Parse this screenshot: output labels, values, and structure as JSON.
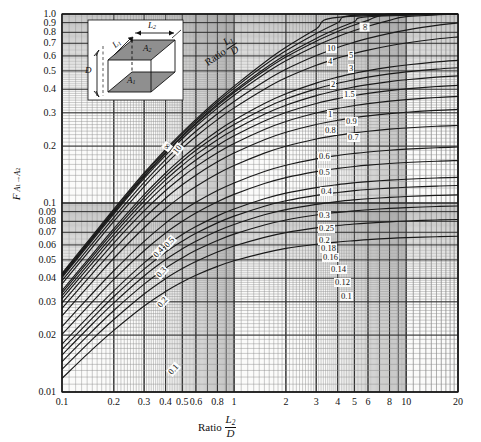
{
  "figure": {
    "kind": "view-factor-chart",
    "plot_box": {
      "left": 62,
      "top": 14,
      "right": 458,
      "bottom": 392
    },
    "background": "#ffffff",
    "grid_color": "#4a4a4a",
    "curve_color": "#1a1a1a",
    "panel_tint": "#f2f2f0"
  },
  "axes": {
    "y_title_F": "F",
    "y_title_sub_a1": "A",
    "y_title_sub_1": "1",
    "y_title_arrow": "→",
    "y_title_sub_a2": "A",
    "y_title_sub_2": "2",
    "y_title_plain": "F A1→A2",
    "x_title_word": "Ratio",
    "x_title_num": "L",
    "x_title_num_sub": "2",
    "x_title_den": "D",
    "x_title_plain": "Ratio L2/D",
    "y_scale": "log",
    "x_scale": "log",
    "ylim": [
      0.01,
      1.0
    ],
    "xlim": [
      0.1,
      20
    ],
    "y_ticks": [
      "0.01",
      "0.02",
      "0.03",
      "0.04",
      "0.05",
      "0.06",
      "0.07",
      "0.08",
      "0.09",
      "0.1",
      "0.2",
      "0.3",
      "0.4",
      "0.5",
      "0.6",
      "0.7",
      "0.8",
      "0.9",
      "1.0"
    ],
    "y_tick_values": [
      0.01,
      0.02,
      0.03,
      0.04,
      0.05,
      0.06,
      0.07,
      0.08,
      0.09,
      0.1,
      0.2,
      0.3,
      0.4,
      0.5,
      0.6,
      0.7,
      0.8,
      0.9,
      1.0
    ],
    "x_ticks": [
      "0.1",
      "0.2",
      "0.3",
      "0.4",
      "0.5",
      "0.6",
      "0.8",
      "1",
      "2",
      "3",
      "4",
      "5",
      "6",
      "8",
      "10",
      "20"
    ],
    "x_tick_values": [
      0.1,
      0.2,
      0.3,
      0.4,
      0.5,
      0.6,
      0.8,
      1,
      2,
      3,
      4,
      5,
      6,
      8,
      10,
      20
    ]
  },
  "family_label": {
    "word": "Ratio",
    "num": "L",
    "num_sub": "1",
    "den": "D",
    "plain": "Ratio L1/D"
  },
  "inset": {
    "a1": "A",
    "a1_sub": "1",
    "a2": "A",
    "a2_sub": "2",
    "l1": "L",
    "l1_sub": "1",
    "l2": "L",
    "l2_sub": "2",
    "d": "D",
    "face_fill": "#8f8f8f",
    "bg": "#ffffff",
    "description": "Two parallel coaxial rectangles A1 (lower) and A2 (upper) separated by distance D, sides L1 and L2"
  },
  "right_labels": [
    "∞",
    "10",
    "5",
    "4",
    "3",
    "2",
    "1.5",
    "1",
    "0.9",
    "0.8",
    "0.7",
    "0.6",
    "0.5",
    "0.4",
    "0.3",
    "0.25",
    "0.2",
    "0.18",
    "0.16",
    "0.14",
    "0.12",
    "0.1"
  ],
  "left_labels": [
    "10",
    "∞",
    "0.5",
    "0.4",
    "0.3",
    "0.2",
    "0.1"
  ],
  "chart_data": {
    "type": "line",
    "title": "",
    "subtitle": "",
    "xlabel": "Ratio L2/D",
    "ylabel": "F A1→A2",
    "xscale": "log",
    "yscale": "log",
    "xlim": [
      0.1,
      20
    ],
    "ylim": [
      0.01,
      1.0
    ],
    "grid": true,
    "legend_position": "inline-right-and-left-curve-end-labels",
    "legend_title": "Ratio L1/D",
    "x": [
      0.1,
      0.15,
      0.2,
      0.3,
      0.4,
      0.5,
      0.6,
      0.8,
      1,
      1.5,
      2,
      3,
      4,
      5,
      6,
      8,
      10,
      15,
      20
    ],
    "series": [
      {
        "name": "0.1",
        "values": [
          0.0118,
          0.0168,
          0.0212,
          0.0285,
          0.034,
          0.0382,
          0.0415,
          0.0462,
          0.0495,
          0.0545,
          0.0575,
          0.0605,
          0.0622,
          0.0632,
          0.064,
          0.065,
          0.0656,
          0.0663,
          0.0667
        ]
      },
      {
        "name": "0.12",
        "values": [
          0.0132,
          0.019,
          0.0242,
          0.033,
          0.0398,
          0.045,
          0.049,
          0.055,
          0.0592,
          0.0658,
          0.0697,
          0.0738,
          0.076,
          0.0774,
          0.0783,
          0.0795,
          0.0803,
          0.0813,
          0.0818
        ]
      },
      {
        "name": "0.14",
        "values": [
          0.0145,
          0.021,
          0.027,
          0.0372,
          0.0452,
          0.0513,
          0.0562,
          0.0633,
          0.0684,
          0.0765,
          0.0813,
          0.0864,
          0.0892,
          0.0909,
          0.0921,
          0.0936,
          0.0945,
          0.0958,
          0.0964
        ]
      },
      {
        "name": "0.16",
        "values": [
          0.0157,
          0.0229,
          0.0296,
          0.0411,
          0.0502,
          0.0572,
          0.0628,
          0.0711,
          0.077,
          0.0866,
          0.0923,
          0.0984,
          0.1018,
          0.1039,
          0.1053,
          0.1071,
          0.1082,
          0.1097,
          0.1104
        ]
      },
      {
        "name": "0.18",
        "values": [
          0.0168,
          0.0246,
          0.032,
          0.0447,
          0.0549,
          0.0628,
          0.0691,
          0.0785,
          0.0852,
          0.0962,
          0.1028,
          0.1098,
          0.1137,
          0.1162,
          0.1178,
          0.1199,
          0.1212,
          0.1229,
          0.1238
        ]
      },
      {
        "name": "0.2",
        "values": [
          0.0179,
          0.0263,
          0.0343,
          0.0482,
          0.0593,
          0.0681,
          0.075,
          0.0855,
          0.093,
          0.1053,
          0.1128,
          0.1207,
          0.1251,
          0.1279,
          0.1298,
          0.1322,
          0.1336,
          0.1356,
          0.1366
        ]
      },
      {
        "name": "0.25",
        "values": [
          0.0202,
          0.03,
          0.0394,
          0.0559,
          0.0694,
          0.08,
          0.0886,
          0.1016,
          0.1111,
          0.1268,
          0.1363,
          0.1466,
          0.1524,
          0.1561,
          0.1586,
          0.1618,
          0.1637,
          0.1664,
          0.1677
        ]
      },
      {
        "name": "0.3",
        "values": [
          0.0222,
          0.0332,
          0.0438,
          0.0627,
          0.0783,
          0.0907,
          0.1008,
          0.1163,
          0.1277,
          0.1467,
          0.1584,
          0.1712,
          0.1784,
          0.183,
          0.1862,
          0.1902,
          0.1927,
          0.1961,
          0.1978
        ]
      },
      {
        "name": "0.4",
        "values": [
          0.0253,
          0.0383,
          0.051,
          0.074,
          0.0935,
          0.1093,
          0.1223,
          0.1426,
          0.1578,
          0.1836,
          0.1998,
          0.218,
          0.2284,
          0.2351,
          0.2398,
          0.2458,
          0.2495,
          0.2546,
          0.2572
        ]
      },
      {
        "name": "0.5",
        "values": [
          0.0277,
          0.0423,
          0.0567,
          0.0832,
          0.106,
          0.1248,
          0.1404,
          0.1651,
          0.1838,
          0.216,
          0.2367,
          0.2603,
          0.274,
          0.2829,
          0.2891,
          0.2972,
          0.3022,
          0.3092,
          0.3127
        ]
      },
      {
        "name": "0.6",
        "values": [
          0.0296,
          0.0455,
          0.0614,
          0.0908,
          0.1164,
          0.1378,
          0.1558,
          0.1845,
          0.2065,
          0.245,
          0.2701,
          0.2993,
          0.3165,
          0.3278,
          0.3357,
          0.3461,
          0.3526,
          0.3617,
          0.3664
        ]
      },
      {
        "name": "0.7",
        "values": [
          0.0312,
          0.0481,
          0.0651,
          0.0971,
          0.1251,
          0.1488,
          0.1689,
          0.2015,
          0.2267,
          0.2713,
          0.301,
          0.3359,
          0.3568,
          0.3707,
          0.3805,
          0.3935,
          0.4017,
          0.4132,
          0.4191
        ]
      },
      {
        "name": "0.8",
        "values": [
          0.0324,
          0.0502,
          0.0683,
          0.1023,
          0.1325,
          0.1582,
          0.1802,
          0.2162,
          0.2444,
          0.295,
          0.3292,
          0.37,
          0.3948,
          0.4114,
          0.4232,
          0.439,
          0.449,
          0.4632,
          0.4705
        ]
      },
      {
        "name": "0.9",
        "values": [
          0.0335,
          0.052,
          0.0709,
          0.1068,
          0.1387,
          0.1663,
          0.19,
          0.2291,
          0.2601,
          0.3164,
          0.3549,
          0.4014,
          0.43,
          0.4494,
          0.4632,
          0.4818,
          0.4937,
          0.5107,
          0.5195
        ]
      },
      {
        "name": "1",
        "values": [
          0.0344,
          0.0535,
          0.0731,
          0.1106,
          0.1441,
          0.1732,
          0.1985,
          0.2404,
          0.2739,
          0.3357,
          0.3784,
          0.4307,
          0.4633,
          0.4856,
          0.5016,
          0.5234,
          0.5374,
          0.5576,
          0.5682
        ]
      },
      {
        "name": "1.5",
        "values": [
          0.0373,
          0.0583,
          0.08,
          0.1222,
          0.1606,
          0.1947,
          0.2248,
          0.2761,
          0.3187,
          0.4004,
          0.4597,
          0.5356,
          0.5846,
          0.619,
          0.6443,
          0.6794,
          0.7026,
          0.7375,
          0.7562
        ]
      },
      {
        "name": "2",
        "values": [
          0.0388,
          0.0609,
          0.0837,
          0.1285,
          0.1697,
          0.2066,
          0.2396,
          0.2966,
          0.3446,
          0.4393,
          0.5096,
          0.6027,
          0.665,
          0.7097,
          0.7431,
          0.7901,
          0.8217,
          0.8702,
          0.8968
        ]
      },
      {
        "name": "3",
        "values": [
          0.0403,
          0.0634,
          0.0874,
          0.1348,
          0.1788,
          0.2187,
          0.2546,
          0.3177,
          0.3717,
          0.4813,
          0.565,
          0.6794,
          0.7589,
          0.8173,
          0.8617,
          0.925,
          0.9679,
          1.0,
          1.0
        ]
      },
      {
        "name": "4",
        "values": [
          0.0409,
          0.0645,
          0.089,
          0.1376,
          0.1828,
          0.224,
          0.2613,
          0.3273,
          0.3842,
          0.5013,
          0.592,
          0.7184,
          0.8079,
          0.8744,
          0.9256,
          0.9991,
          1.0,
          1.0,
          1.0
        ]
      },
      {
        "name": "5",
        "values": [
          0.0413,
          0.0651,
          0.0899,
          0.1392,
          0.1851,
          0.227,
          0.2651,
          0.3328,
          0.3915,
          0.5133,
          0.6084,
          0.7427,
          0.8388,
          0.911,
          0.9669,
          1.0,
          1.0,
          1.0,
          1.0
        ]
      },
      {
        "name": "10",
        "values": [
          0.0419,
          0.0662,
          0.0915,
          0.1419,
          0.189,
          0.2322,
          0.2717,
          0.3424,
          0.4043,
          0.5351,
          0.6388,
          0.7888,
          0.8986,
          0.9828,
          1.0,
          1.0,
          1.0,
          1.0,
          1.0
        ]
      },
      {
        "name": "∞",
        "values": [
          0.0424,
          0.0671,
          0.0928,
          0.1442,
          0.1923,
          0.2366,
          0.2772,
          0.3505,
          0.4152,
          0.5543,
          0.6667,
          0.8333,
          0.96,
          1.0,
          1.0,
          1.0,
          1.0,
          1.0,
          1.0
        ]
      }
    ]
  }
}
